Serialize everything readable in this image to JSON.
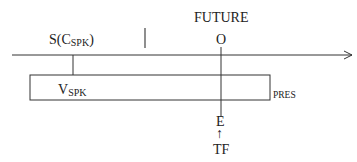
{
  "diagram": {
    "type": "tense-timeline",
    "labels": {
      "future": "FUTURE",
      "speech_time_main": "S(C",
      "speech_time_sub": "SPK",
      "speech_time_close": ")",
      "origin": "O",
      "validity_main": "V",
      "validity_sub": "SPK",
      "present": "PRES",
      "event": "E",
      "tf": "TF",
      "arrow_up": "↑"
    },
    "colors": {
      "line": "#333333",
      "text": "#222222",
      "background": "#ffffff"
    }
  }
}
